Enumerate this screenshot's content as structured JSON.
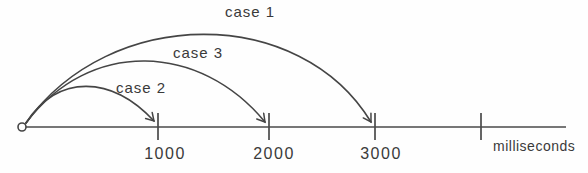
{
  "figure": {
    "type": "timeline-arc-diagram",
    "colors": {
      "line": "#454545",
      "text": "#3a3a3a",
      "background": "#fefefe"
    },
    "axis": {
      "unit_label": "milliseconds",
      "ticks": [
        {
          "value": "1000"
        },
        {
          "value": "2000"
        },
        {
          "value": "3000"
        },
        {
          "value": ""
        }
      ]
    },
    "arcs": [
      {
        "label": "case 1",
        "from_ms": 0,
        "to_ms": 3000
      },
      {
        "label": "case 3",
        "from_ms": 0,
        "to_ms": 2000
      },
      {
        "label": "case 2",
        "from_ms": 0,
        "to_ms": 1000
      }
    ]
  }
}
